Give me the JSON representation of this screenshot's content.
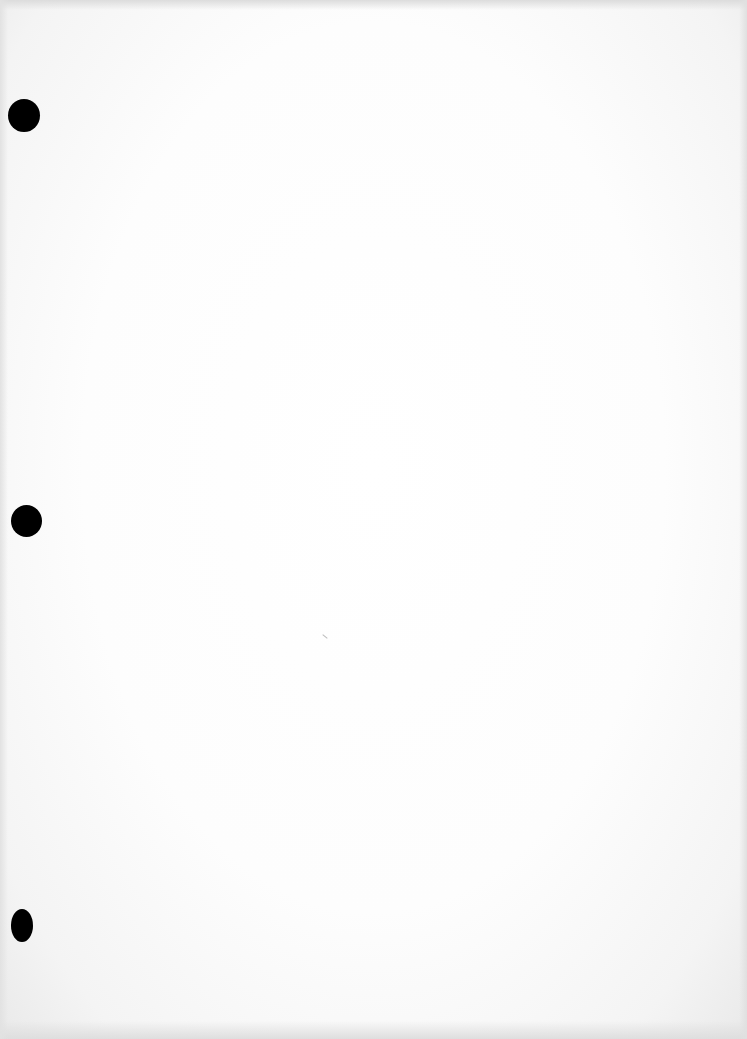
{
  "document": {
    "type": "blank scanned page",
    "text": "",
    "punch_holes": [
      {
        "position": "top",
        "color": "#000000"
      },
      {
        "position": "middle",
        "color": "#000000"
      },
      {
        "position": "bottom",
        "color": "#000000"
      }
    ],
    "paper_color": "#ffffff"
  }
}
